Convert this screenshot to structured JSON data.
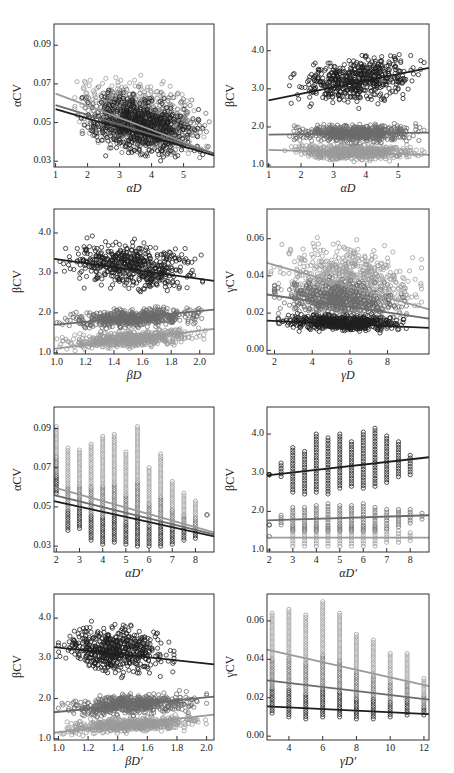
{
  "colors": {
    "dark": "#1e1e1e",
    "mid": "#6b6b6b",
    "light": "#9a9a9a",
    "frame": "#333333"
  },
  "chart_data": [
    {
      "id": "p1",
      "type": "scatter",
      "title": "",
      "xlabel": "αD",
      "ylabel": "αCV",
      "xlim": [
        0.95,
        5.95
      ],
      "ylim": [
        0.027,
        0.101
      ],
      "xticks": [
        1,
        2,
        3,
        4,
        5
      ],
      "xtick_labels": [
        "1",
        "2",
        "3",
        "4",
        "5"
      ],
      "yticks": [
        0.03,
        0.05,
        0.07,
        0.09
      ],
      "ytick_labels": [
        "0.03",
        "0.05",
        "0.07",
        "0.09"
      ],
      "series": [
        {
          "name": "series-light",
          "color": "light",
          "cloud": {
            "x": [
              1.6,
              5.8
            ],
            "y": [
              0.032,
              0.085
            ]
          },
          "fit": [
            [
              1,
              0.065
            ],
            [
              5.95,
              0.034
            ]
          ]
        },
        {
          "name": "series-mid",
          "color": "mid",
          "cloud": {
            "x": [
              1.7,
              5.8
            ],
            "y": [
              0.031,
              0.078
            ]
          },
          "fit": [
            [
              1,
              0.059
            ],
            [
              5.95,
              0.034
            ]
          ]
        },
        {
          "name": "series-dark",
          "color": "dark",
          "cloud": {
            "x": [
              1.8,
              5.6
            ],
            "y": [
              0.03,
              0.075
            ]
          },
          "fit": [
            [
              1,
              0.057
            ],
            [
              5.95,
              0.033
            ]
          ]
        }
      ]
    },
    {
      "id": "p2",
      "type": "scatter",
      "title": "",
      "xlabel": "αD",
      "ylabel": "βCV",
      "xlim": [
        0.95,
        5.95
      ],
      "ylim": [
        0.95,
        4.7
      ],
      "xticks": [
        1,
        2,
        3,
        4,
        5
      ],
      "xtick_labels": [
        "1",
        "2",
        "3",
        "4",
        "5"
      ],
      "yticks": [
        1.0,
        2.0,
        3.0,
        4.0
      ],
      "ytick_labels": [
        "1.0",
        "2.0",
        "3.0",
        "4.0"
      ],
      "series": [
        {
          "name": "series-dark",
          "color": "dark",
          "cloud": {
            "x": [
              1.6,
              5.8
            ],
            "y": [
              2.45,
              4.15
            ]
          },
          "fit": [
            [
              1,
              2.7
            ],
            [
              5.95,
              3.55
            ]
          ]
        },
        {
          "name": "series-mid",
          "color": "mid",
          "cloud": {
            "x": [
              1.6,
              5.8
            ],
            "y": [
              1.5,
              2.2
            ]
          },
          "fit": [
            [
              1,
              1.8
            ],
            [
              5.95,
              1.85
            ]
          ]
        },
        {
          "name": "series-light",
          "color": "light",
          "cloud": {
            "x": [
              1.5,
              5.8
            ],
            "y": [
              1.05,
              1.65
            ]
          },
          "fit": [
            [
              1,
              1.4
            ],
            [
              5.95,
              1.27
            ]
          ]
        }
      ]
    },
    {
      "id": "p3",
      "type": "scatter",
      "title": "",
      "xlabel": "βD",
      "ylabel": "βCV",
      "xlim": [
        0.98,
        2.1
      ],
      "ylim": [
        0.97,
        4.6
      ],
      "xticks": [
        1.0,
        1.2,
        1.4,
        1.6,
        1.8,
        2.0
      ],
      "xtick_labels": [
        "1.0",
        "1.2",
        "1.4",
        "1.6",
        "1.8",
        "2.0"
      ],
      "yticks": [
        1.0,
        2.0,
        3.0,
        4.0
      ],
      "ytick_labels": [
        "1.0",
        "2.0",
        "3.0",
        "4.0"
      ],
      "series": [
        {
          "name": "series-dark",
          "color": "dark",
          "cloud": {
            "x": [
              1.0,
              2.02
            ],
            "y": [
              2.45,
              4.1
            ]
          },
          "fit": [
            [
              0.98,
              3.35
            ],
            [
              2.1,
              2.8
            ]
          ]
        },
        {
          "name": "series-mid",
          "color": "mid",
          "cloud": {
            "x": [
              1.0,
              2.05
            ],
            "y": [
              1.5,
              2.2
            ]
          },
          "fit": [
            [
              0.98,
              1.7
            ],
            [
              2.1,
              2.08
            ]
          ]
        },
        {
          "name": "series-light",
          "color": "light",
          "cloud": {
            "x": [
              1.0,
              2.05
            ],
            "y": [
              1.05,
              1.65
            ]
          },
          "fit": [
            [
              0.98,
              1.1
            ],
            [
              2.1,
              1.6
            ]
          ]
        }
      ]
    },
    {
      "id": "p4",
      "type": "scatter",
      "title": "",
      "xlabel": "γD",
      "ylabel": "γCV",
      "xlim": [
        1.6,
        10.2
      ],
      "ylim": [
        -0.002,
        0.076
      ],
      "xticks": [
        2,
        4,
        6,
        8
      ],
      "xtick_labels": [
        "2",
        "4",
        "6",
        "8"
      ],
      "yticks": [
        0.0,
        0.02,
        0.04,
        0.06
      ],
      "ytick_labels": [
        "0.00",
        "0.02",
        "0.04",
        "0.06"
      ],
      "series": [
        {
          "name": "series-light",
          "color": "light",
          "cloud": {
            "x": [
              1.8,
              9.8
            ],
            "y": [
              0.018,
              0.069
            ]
          },
          "fit": [
            [
              1.6,
              0.047
            ],
            [
              10.2,
              0.022
            ]
          ]
        },
        {
          "name": "series-mid",
          "color": "mid",
          "cloud": {
            "x": [
              2.0,
              9.0
            ],
            "y": [
              0.015,
              0.045
            ]
          },
          "fit": [
            [
              1.6,
              0.03
            ],
            [
              10.2,
              0.017
            ]
          ]
        },
        {
          "name": "series-dark",
          "color": "dark",
          "cloud": {
            "x": [
              2.2,
              9.2
            ],
            "y": [
              0.009,
              0.022
            ]
          },
          "fit": [
            [
              1.6,
              0.016
            ],
            [
              10.2,
              0.012
            ]
          ]
        }
      ]
    },
    {
      "id": "p5",
      "type": "scatter",
      "title": "",
      "xlabel": "αD′",
      "ylabel": "αCV",
      "xlim": [
        1.9,
        8.8
      ],
      "ylim": [
        0.027,
        0.101
      ],
      "xticks": [
        2,
        3,
        4,
        5,
        6,
        7,
        8
      ],
      "xtick_labels": [
        "2",
        "3",
        "4",
        "5",
        "6",
        "7",
        "8"
      ],
      "yticks": [
        0.03,
        0.05,
        0.07,
        0.09
      ],
      "ytick_labels": [
        "0.03",
        "0.05",
        "0.07",
        "0.09"
      ],
      "discrete_x": [
        2,
        2.5,
        3,
        3.5,
        4,
        4.5,
        5,
        5.5,
        6,
        6.5,
        7,
        7.5,
        8,
        8.5
      ],
      "column_ranges": [
        [
          0.057,
          0.091
        ],
        [
          0.038,
          0.08
        ],
        [
          0.039,
          0.079
        ],
        [
          0.033,
          0.082
        ],
        [
          0.031,
          0.086
        ],
        [
          0.032,
          0.087
        ],
        [
          0.031,
          0.078
        ],
        [
          0.03,
          0.091
        ],
        [
          0.03,
          0.07
        ],
        [
          0.03,
          0.077
        ],
        [
          0.031,
          0.063
        ],
        [
          0.033,
          0.057
        ],
        [
          0.034,
          0.053
        ],
        [
          0.046,
          0.046
        ]
      ],
      "series": [
        {
          "name": "series-light",
          "color": "light",
          "fit": [
            [
              1.9,
              0.06
            ],
            [
              8.8,
              0.037
            ]
          ]
        },
        {
          "name": "series-mid",
          "color": "mid",
          "fit": [
            [
              1.9,
              0.056
            ],
            [
              8.8,
              0.036
            ]
          ]
        },
        {
          "name": "series-dark",
          "color": "dark",
          "fit": [
            [
              1.9,
              0.053
            ],
            [
              8.8,
              0.035
            ]
          ]
        }
      ]
    },
    {
      "id": "p6",
      "type": "scatter",
      "title": "",
      "xlabel": "αD′",
      "ylabel": "βCV",
      "xlim": [
        1.9,
        8.8
      ],
      "ylim": [
        0.95,
        4.7
      ],
      "xticks": [
        2,
        3,
        4,
        5,
        6,
        7,
        8
      ],
      "xtick_labels": [
        "2",
        "3",
        "4",
        "5",
        "6",
        "7",
        "8"
      ],
      "yticks": [
        1.0,
        2.0,
        3.0,
        4.0
      ],
      "ytick_labels": [
        "1.0",
        "2.0",
        "3.0",
        "4.0"
      ],
      "discrete_x": [
        2,
        2.5,
        3,
        3.5,
        4,
        4.5,
        5,
        5.5,
        6,
        6.5,
        7,
        7.5,
        8,
        8.5
      ],
      "series": [
        {
          "name": "series-dark",
          "color": "dark",
          "column_ranges": [
            [
              2.95,
              2.95
            ],
            [
              2.9,
              3.25
            ],
            [
              2.5,
              3.65
            ],
            [
              2.45,
              3.55
            ],
            [
              2.5,
              4.0
            ],
            [
              2.45,
              3.9
            ],
            [
              2.6,
              4.0
            ],
            [
              2.65,
              3.8
            ],
            [
              2.6,
              4.05
            ],
            [
              2.65,
              4.15
            ],
            [
              2.75,
              3.95
            ],
            [
              2.9,
              3.8
            ],
            [
              2.95,
              3.45
            ],
            null
          ],
          "fit": [
            [
              1.9,
              2.93
            ],
            [
              8.8,
              3.4
            ]
          ]
        },
        {
          "name": "series-mid",
          "color": "mid",
          "column_ranges": [
            [
              1.65,
              1.65
            ],
            [
              1.65,
              1.9
            ],
            [
              1.5,
              2.1
            ],
            [
              1.5,
              2.1
            ],
            [
              1.5,
              2.15
            ],
            [
              1.5,
              2.2
            ],
            [
              1.5,
              2.15
            ],
            [
              1.5,
              2.15
            ],
            [
              1.5,
              2.2
            ],
            [
              1.5,
              2.1
            ],
            [
              1.55,
              2.05
            ],
            [
              1.6,
              2.05
            ],
            [
              1.7,
              2.05
            ],
            [
              1.8,
              1.95
            ]
          ],
          "fit": [
            [
              1.9,
              1.77
            ],
            [
              8.8,
              1.9
            ]
          ]
        },
        {
          "name": "series-light",
          "color": "light",
          "column_ranges": [
            [
              1.35,
              1.35
            ],
            [
              null,
              null
            ],
            [
              1.1,
              1.6
            ],
            [
              1.1,
              1.6
            ],
            [
              1.1,
              1.6
            ],
            [
              1.1,
              1.6
            ],
            [
              1.1,
              1.6
            ],
            [
              1.1,
              1.6
            ],
            [
              1.1,
              1.6
            ],
            [
              1.1,
              1.6
            ],
            [
              1.2,
              1.55
            ],
            [
              1.2,
              1.5
            ],
            [
              1.25,
              1.45
            ],
            null
          ],
          "fit": [
            [
              1.9,
              1.32
            ],
            [
              8.8,
              1.32
            ]
          ]
        }
      ]
    },
    {
      "id": "p7",
      "type": "scatter",
      "title": "",
      "xlabel": "βD′",
      "ylabel": "βCV",
      "xlim": [
        0.97,
        2.05
      ],
      "ylim": [
        0.97,
        4.6
      ],
      "xticks": [
        1.0,
        1.2,
        1.4,
        1.6,
        1.8,
        2.0
      ],
      "xtick_labels": [
        "1.0",
        "1.2",
        "1.4",
        "1.6",
        "1.8",
        "2.0"
      ],
      "yticks": [
        1.0,
        2.0,
        3.0,
        4.0
      ],
      "ytick_labels": [
        "1.0",
        "2.0",
        "3.0",
        "4.0"
      ],
      "series": [
        {
          "name": "series-dark",
          "color": "dark",
          "cloud": {
            "x": [
              1.0,
              1.78
            ],
            "y": [
              2.45,
              4.15
            ]
          },
          "fit": [
            [
              0.97,
              3.28
            ],
            [
              2.05,
              2.85
            ]
          ]
        },
        {
          "name": "series-mid",
          "color": "mid",
          "cloud": {
            "x": [
              1.0,
              2.0
            ],
            "y": [
              1.5,
              2.2
            ]
          },
          "fit": [
            [
              0.97,
              1.66
            ],
            [
              2.05,
              2.05
            ]
          ]
        },
        {
          "name": "series-light",
          "color": "light",
          "cloud": {
            "x": [
              1.0,
              2.0
            ],
            "y": [
              1.05,
              1.6
            ]
          },
          "fit": [
            [
              0.97,
              1.15
            ],
            [
              2.05,
              1.6
            ]
          ]
        }
      ]
    },
    {
      "id": "p8",
      "type": "scatter",
      "title": "",
      "xlabel": "γD′",
      "ylabel": "γCV",
      "xlim": [
        2.7,
        12.3
      ],
      "ylim": [
        -0.002,
        0.074
      ],
      "xticks": [
        4,
        6,
        8,
        10,
        12
      ],
      "xtick_labels": [
        "4",
        "6",
        "8",
        "10",
        "12"
      ],
      "yticks": [
        0.0,
        0.02,
        0.04,
        0.06
      ],
      "ytick_labels": [
        "0.00",
        "0.02",
        "0.04",
        "0.06"
      ],
      "discrete_x": [
        3,
        4,
        5,
        6,
        7,
        8,
        9,
        10,
        11,
        12
      ],
      "column_ranges": [
        [
          0.012,
          0.064
        ],
        [
          0.01,
          0.066
        ],
        [
          0.009,
          0.063
        ],
        [
          0.01,
          0.07
        ],
        [
          0.01,
          0.064
        ],
        [
          0.009,
          0.053
        ],
        [
          0.009,
          0.05
        ],
        [
          0.01,
          0.043
        ],
        [
          0.011,
          0.043
        ],
        [
          0.011,
          0.03
        ]
      ],
      "series": [
        {
          "name": "series-light",
          "color": "light",
          "fit": [
            [
              2.7,
              0.045
            ],
            [
              12.3,
              0.026
            ]
          ]
        },
        {
          "name": "series-mid",
          "color": "mid",
          "fit": [
            [
              2.7,
              0.029
            ],
            [
              12.3,
              0.019
            ]
          ]
        },
        {
          "name": "series-dark",
          "color": "dark",
          "fit": [
            [
              2.7,
              0.0155
            ],
            [
              12.3,
              0.0115
            ]
          ]
        }
      ]
    }
  ],
  "panels": [
    {
      "ylabel": "αCV",
      "xlabel": "αD"
    },
    {
      "ylabel": "βCV",
      "xlabel": "αD"
    },
    {
      "ylabel": "βCV",
      "xlabel": "βD"
    },
    {
      "ylabel": "γCV",
      "xlabel": "γD"
    },
    {
      "ylabel": "αCV",
      "xlabel": "αD′"
    },
    {
      "ylabel": "βCV",
      "xlabel": "αD′"
    },
    {
      "ylabel": "βCV",
      "xlabel": "βD′"
    },
    {
      "ylabel": "γCV",
      "xlabel": "γD′"
    }
  ]
}
